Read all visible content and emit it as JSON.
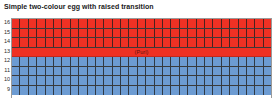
{
  "chart_data": {
    "type": "heatmap",
    "title": "Simple two-colour egg with raised transition",
    "xlabel": "",
    "ylabel": "",
    "grid": true,
    "legend_position": "none",
    "columns": 31,
    "row_labels": [
      "16",
      "15",
      "14",
      "13",
      "12",
      "11",
      "10",
      "9"
    ],
    "rows": [
      {
        "label": "16",
        "colour": "red",
        "colour_hex": "#ee3124",
        "style": "cells",
        "annotation": ""
      },
      {
        "label": "15",
        "colour": "red",
        "colour_hex": "#ee3124",
        "style": "cells",
        "annotation": ""
      },
      {
        "label": "14",
        "colour": "red",
        "colour_hex": "#ee3124",
        "style": "cells",
        "annotation": ""
      },
      {
        "label": "13",
        "colour": "red",
        "colour_hex": "#ee3124",
        "style": "solid",
        "annotation": "(Purl)"
      },
      {
        "label": "12",
        "colour": "blue",
        "colour_hex": "#6c9bd2",
        "style": "cells",
        "annotation": ""
      },
      {
        "label": "11",
        "colour": "blue",
        "colour_hex": "#6c9bd2",
        "style": "cells",
        "annotation": ""
      },
      {
        "label": "10",
        "colour": "blue",
        "colour_hex": "#6c9bd2",
        "style": "cells",
        "annotation": ""
      },
      {
        "label": "9",
        "colour": "blue",
        "colour_hex": "#6c9bd2",
        "style": "cells",
        "annotation": ""
      }
    ],
    "colours": {
      "upper": "#ee3124",
      "lower": "#6c9bd2",
      "gridline": "#3a3a3a",
      "background": "#ffffff",
      "text": "#1a1a1a"
    }
  }
}
